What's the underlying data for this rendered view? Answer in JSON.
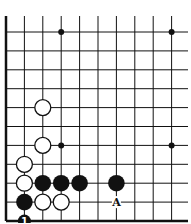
{
  "board": {
    "x0": 6,
    "y0": 32,
    "dx": 18.4,
    "dy": 18.9,
    "cols": 10,
    "rows": 10,
    "top_extend": 16,
    "right_extend": 188,
    "line_color": "#111111"
  },
  "star_points": [
    [
      3,
      0
    ],
    [
      9,
      0
    ],
    [
      3,
      6
    ],
    [
      9,
      6
    ]
  ],
  "white_stones": [
    [
      2,
      4
    ],
    [
      2,
      6
    ],
    [
      1,
      7
    ],
    [
      1,
      8
    ],
    [
      2,
      9
    ],
    [
      3,
      9
    ]
  ],
  "black_stones": [
    [
      2,
      8
    ],
    [
      3,
      8
    ],
    [
      4,
      8
    ],
    [
      6,
      8
    ],
    [
      1,
      9
    ]
  ],
  "numbered_stones": [
    {
      "col": 1,
      "row": 10,
      "color": "black",
      "label": "1"
    }
  ],
  "labels": [
    {
      "col": 6,
      "row": 9,
      "text": "A"
    }
  ]
}
